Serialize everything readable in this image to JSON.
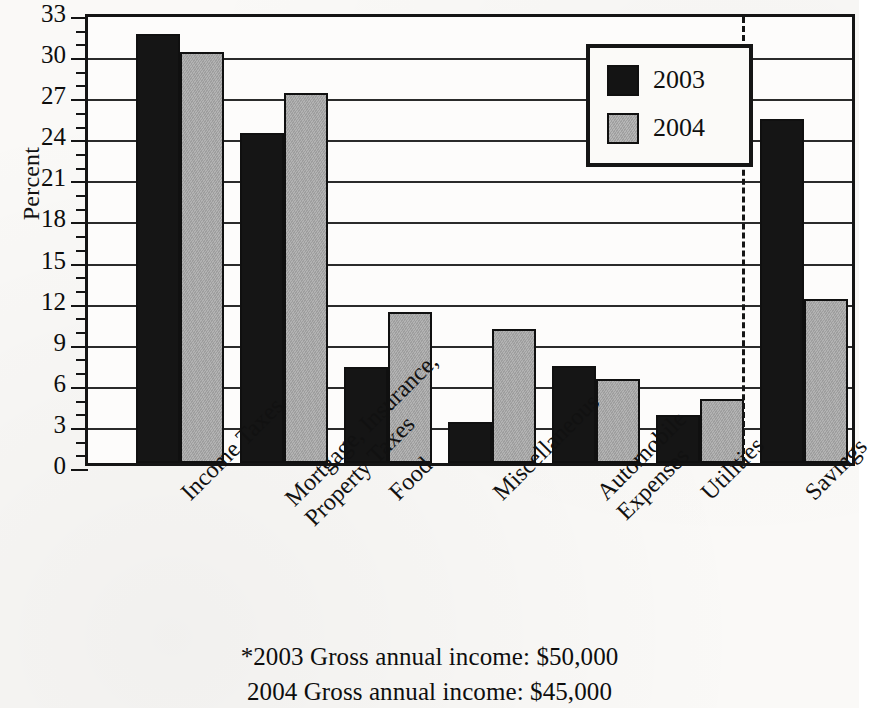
{
  "chart_data": {
    "type": "bar",
    "title": "",
    "xlabel": "",
    "ylabel": "Percent",
    "ylim": [
      0,
      33
    ],
    "ytick_step": 3,
    "yticks": [
      33,
      30,
      27,
      24,
      21,
      18,
      15,
      12,
      9,
      6,
      3,
      0
    ],
    "minor_tick_step": 1,
    "grid": true,
    "legend_position": "upper-center-right",
    "categories": [
      "Income Taxes",
      "Mortgage, Insurance, Property Taxes",
      "Food",
      "Miscellaneous",
      "Automobile Expenses",
      "Utilities",
      "Savings"
    ],
    "category_label_lines": [
      [
        "Income Taxes"
      ],
      [
        "Mortgage, Insurance,",
        "Property Taxes"
      ],
      [
        "Food"
      ],
      [
        "Miscellaneous"
      ],
      [
        "Automobile",
        "Expenses"
      ],
      [
        "Utilities"
      ],
      [
        "Savings"
      ]
    ],
    "series": [
      {
        "name": "2003",
        "color": "#151515",
        "values": [
          31.3,
          24.1,
          7.0,
          3.0,
          7.1,
          3.5,
          25.1
        ]
      },
      {
        "name": "2004",
        "color": "#a6a6a6",
        "values": [
          30.0,
          27.0,
          11.0,
          9.8,
          6.1,
          4.7,
          12.0
        ]
      }
    ],
    "annotations": {
      "divider_after_category": "Utilities",
      "divider_style": "dashed vertical line"
    }
  },
  "axis": {
    "ylabel": "Percent",
    "tick_labels": [
      "33",
      "30",
      "27",
      "24",
      "21",
      "18",
      "15",
      "12",
      "9",
      "6",
      "3",
      "0"
    ]
  },
  "legend": {
    "entries": [
      {
        "label": "2003",
        "swatch": "black-square-icon"
      },
      {
        "label": "2004",
        "swatch": "gray-square-icon"
      }
    ]
  },
  "footnote": {
    "lines": [
      "*2003 Gross annual income:  $50,000",
      "2004 Gross annual income:  $45,000"
    ]
  }
}
